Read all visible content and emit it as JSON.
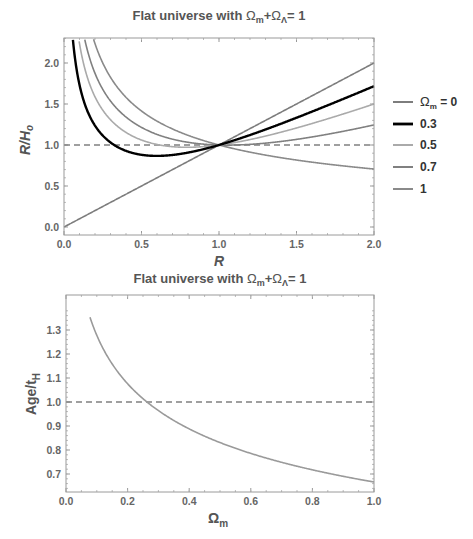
{
  "chart_data": [
    {
      "type": "line",
      "title": "Flat universe with Ωm+ΩΛ=1",
      "title_parts": {
        "prefix": "Flat universe with ",
        "omega": "Ω",
        "m_sub": "m",
        "plus": "+",
        "lambda_sub": "Λ",
        "equals": "= 1"
      },
      "xlabel": "R",
      "ylabel": "Ṙ/H₀",
      "ylabel_parts": {
        "r": "R",
        "slash": "/H",
        "sub": "o"
      },
      "xlim": [
        0,
        2
      ],
      "ylim": [
        -0.1,
        2.35
      ],
      "xticks": [
        "0.0",
        "0.5",
        "1.0",
        "1.5",
        "2.0"
      ],
      "yticks": [
        "0.0",
        "0.5",
        "1.0",
        "1.5",
        "2.0"
      ],
      "formula": "sqrt(Ωm/R + (1-Ωm)R^2)",
      "reference_line": {
        "y": 1.0,
        "style": "dashed"
      },
      "legend_position": "right",
      "series": [
        {
          "name": "Ωm = 0",
          "omega_m": 0.0,
          "color": "#7d7d7d",
          "width": 1.6,
          "x": [
            0.0,
            0.5,
            1.0,
            1.5,
            2.0
          ],
          "values": [
            0.0,
            0.5,
            1.0,
            1.5,
            2.0
          ]
        },
        {
          "name": "0.3",
          "omega_m": 0.3,
          "color": "#000000",
          "width": 2.4,
          "x": [
            0.06,
            0.1,
            0.2,
            0.3,
            0.5,
            0.6,
            0.8,
            1.0,
            1.5,
            2.0
          ],
          "values": [
            2.3,
            1.73,
            1.23,
            1.0,
            0.88,
            0.87,
            0.92,
            1.0,
            1.29,
            1.72
          ]
        },
        {
          "name": "0.5",
          "omega_m": 0.5,
          "color": "#aaaaaa",
          "width": 1.6,
          "x": [
            0.1,
            0.25,
            0.5,
            1.0,
            1.5,
            2.0
          ],
          "values": [
            2.24,
            1.42,
            1.06,
            1.0,
            1.23,
            1.5
          ]
        },
        {
          "name": "0.7",
          "omega_m": 0.7,
          "color": "#808080",
          "width": 1.6,
          "x": [
            0.13,
            0.25,
            0.5,
            1.0,
            1.5,
            2.0
          ],
          "values": [
            2.3,
            1.68,
            1.21,
            1.0,
            1.03,
            1.24
          ]
        },
        {
          "name": "1",
          "omega_m": 1.0,
          "color": "#8a8a8a",
          "width": 1.6,
          "x": [
            0.19,
            0.25,
            0.5,
            1.0,
            1.5,
            2.0
          ],
          "values": [
            2.3,
            2.0,
            1.41,
            1.0,
            0.82,
            0.71
          ]
        }
      ]
    },
    {
      "type": "line",
      "title": "Flat universe with Ωm+ΩΛ=1",
      "title_parts": {
        "prefix": "Flat universe with ",
        "omega": "Ω",
        "m_sub": "m",
        "plus": "+",
        "lambda_sub": "Λ",
        "equals": "= 1"
      },
      "xlabel": "Ωm",
      "xlabel_parts": {
        "omega": "Ω",
        "sub": "m"
      },
      "ylabel": "Age/tH",
      "ylabel_parts": {
        "main": "Age/t",
        "sub": "H"
      },
      "xlim": [
        0,
        1
      ],
      "ylim": [
        0.63,
        1.39
      ],
      "xticks": [
        "0.0",
        "0.2",
        "0.4",
        "0.6",
        "0.8",
        "1.0"
      ],
      "yticks": [
        "0.7",
        "0.8",
        "0.9",
        "1.0",
        "1.1",
        "1.2",
        "1.3"
      ],
      "formula": "(2/3) asinh(sqrt((1-Ωm)/Ωm)) / sqrt(1-Ωm)",
      "reference_line": {
        "y": 1.0,
        "style": "dashed"
      },
      "series": [
        {
          "name": "Age/tH",
          "color": "#9a9a9a",
          "width": 1.6,
          "x": [
            0.08,
            0.1,
            0.2,
            0.26,
            0.3,
            0.4,
            0.5,
            0.6,
            0.7,
            0.8,
            0.9,
            1.0
          ],
          "values": [
            1.35,
            1.28,
            1.08,
            1.0,
            0.96,
            0.89,
            0.83,
            0.78,
            0.74,
            0.71,
            0.69,
            0.667
          ]
        }
      ]
    }
  ],
  "colors": {
    "frame": "#999999",
    "dashed": "#808080",
    "text": "#555555"
  }
}
